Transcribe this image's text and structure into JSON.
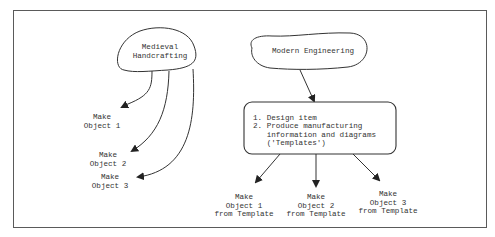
{
  "diagram": {
    "left": {
      "source": "Medieval\nHandcrafting",
      "outputs": [
        "Make\nObject 1",
        "Make\nObject 2",
        "Make\nObject 3"
      ]
    },
    "right": {
      "source": "Modern Engineering",
      "process_steps": [
        "1. Design item",
        "2. Produce manufacturing\n   information and diagrams\n   ('Templates')"
      ],
      "outputs": [
        "Make\nObject 1\nfrom Template",
        "Make\nObject 2\nfrom Template",
        "Make\nObject 3\nfrom Template"
      ]
    },
    "colors": {
      "stroke": "#333333",
      "frame": "#5a5a5a",
      "background": "#ffffff"
    }
  }
}
